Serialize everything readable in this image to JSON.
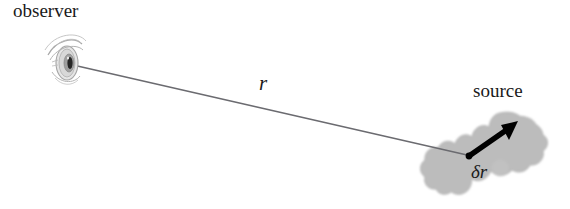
{
  "figure": {
    "background_color": "#ffffff",
    "width": 570,
    "height": 209
  },
  "labels": {
    "observer": "observer",
    "source": "source",
    "distance": "r",
    "depth_element": "δr"
  },
  "colors": {
    "sight_line": "#6b6b70",
    "blob_fill": "#bcbcbc",
    "blob_edge": "#b0b0b0",
    "arrow": "#000000",
    "eye_sketch": "#9a9a9a",
    "eye_pupil": "#262626",
    "text": "#1a1a1a"
  },
  "geometry": {
    "eye_center_x": 66,
    "eye_center_y": 62,
    "sight_line_start": [
      73,
      65
    ],
    "sight_line_end": [
      467,
      155
    ],
    "arrow_tail": [
      468,
      156
    ],
    "arrow_head": [
      515,
      123
    ],
    "blob_bounds": [
      448,
      112,
      548,
      202
    ]
  },
  "icons": {
    "eye": "eye-icon",
    "arrow": "arrow-icon",
    "source_cloud": "cloud-blob-icon"
  }
}
